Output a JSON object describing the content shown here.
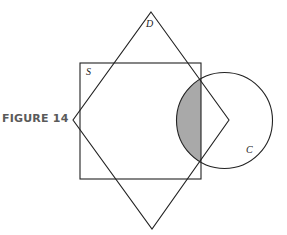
{
  "figure": {
    "caption": "FIGURE 14",
    "labels": {
      "diamond": "D",
      "square": "S",
      "circle": "C"
    },
    "colors": {
      "stroke": "#222222",
      "shade": "#a9a9a9",
      "caption": "#5a5a5a"
    },
    "shapes": {
      "square": {
        "x": 80,
        "y": 63,
        "width": 121,
        "height": 116
      },
      "diamond": {
        "top": [
          151,
          12
        ],
        "right": [
          229,
          120
        ],
        "bottom": [
          152,
          229
        ],
        "left": [
          73,
          120
        ]
      },
      "circle": {
        "cx": 224.5,
        "cy": 120.5,
        "r": 48
      },
      "shaded_region": "intersection of circle C and square S (left of square's right edge)"
    }
  }
}
